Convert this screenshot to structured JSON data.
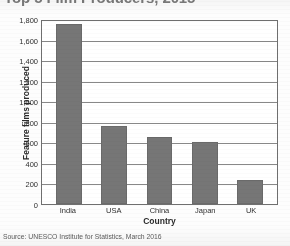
{
  "chart_data": {
    "type": "bar",
    "title": "Top 5 Film Producers, 2015",
    "categories": [
      "India",
      "USA",
      "China",
      "Japan",
      "UK"
    ],
    "values": [
      1750,
      760,
      650,
      605,
      230
    ],
    "xlabel": "Country",
    "ylabel": "Feature films produced",
    "ylim": [
      0,
      1800
    ],
    "ytick_step": 200,
    "ytick_labels": [
      "1,800",
      "1,600",
      "1,400",
      "1,200",
      "1,000",
      "800",
      "600",
      "400",
      "200",
      "0"
    ],
    "ytick_values": [
      1800,
      1600,
      1400,
      1200,
      1000,
      800,
      600,
      400,
      200,
      0
    ],
    "grid": true,
    "legend": "none",
    "bar_color": "#767676",
    "axis_color": "#6f6f6f",
    "gridline_color": "#888888"
  },
  "source_note": "Source: UNESCO Institute for Statistics, March 2016"
}
